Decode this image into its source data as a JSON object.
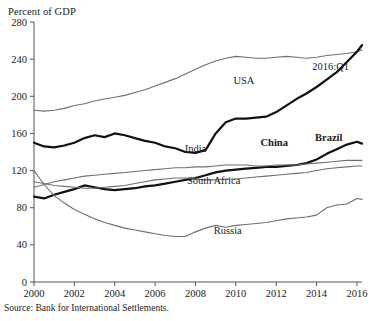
{
  "chart_data": {
    "type": "line",
    "title": "",
    "ylabel": "Percent of GDP",
    "xlabel": "",
    "ylim": [
      0,
      280
    ],
    "xlim": [
      2000,
      2016.25
    ],
    "yticks": [
      0,
      40,
      80,
      120,
      160,
      200,
      240,
      280
    ],
    "xticks": [
      2000,
      2002,
      2004,
      2006,
      2008,
      2010,
      2012,
      2014,
      2016
    ],
    "grid": false,
    "legend_position": "inline-annotations",
    "annotations": [
      {
        "text": "2016:Q1",
        "x": 2014.7,
        "y": 228
      },
      {
        "text": "Percent of GDP",
        "x": 2000,
        "y": 288
      }
    ],
    "source": "Source: Bank for International Settlements.",
    "series": [
      {
        "name": "USA",
        "style": "thin-gray",
        "color": "#6f6f6f",
        "label_x": 2010.4,
        "label_y": 213,
        "x": [
          2000,
          2000.5,
          2001,
          2001.5,
          2002,
          2002.5,
          2003,
          2003.5,
          2004,
          2004.5,
          2005,
          2005.5,
          2006,
          2006.5,
          2007,
          2007.5,
          2008,
          2008.5,
          2009,
          2009.5,
          2010,
          2010.5,
          2011,
          2011.5,
          2012,
          2012.5,
          2013,
          2013.5,
          2014,
          2014.5,
          2015,
          2015.5,
          2016,
          2016.25
        ],
        "y": [
          185,
          184,
          185,
          187,
          190,
          192,
          195,
          197,
          199,
          201,
          204,
          207,
          211,
          215,
          219,
          224,
          229,
          234,
          238,
          241,
          243,
          242,
          241,
          241,
          242,
          243,
          242,
          241,
          242,
          244,
          245,
          246,
          248,
          250
        ]
      },
      {
        "name": "China",
        "style": "thick-black",
        "color": "#111111",
        "label_x": 2011.9,
        "label_y": 146,
        "x": [
          2000,
          2000.5,
          2001,
          2001.5,
          2002,
          2002.5,
          2003,
          2003.5,
          2004,
          2004.5,
          2005,
          2005.5,
          2006,
          2006.5,
          2007,
          2007.5,
          2008,
          2008.5,
          2009,
          2009.5,
          2010,
          2010.5,
          2011,
          2011.5,
          2012,
          2012.5,
          2013,
          2013.5,
          2014,
          2014.5,
          2015,
          2015.5,
          2016,
          2016.25
        ],
        "y": [
          150,
          146,
          145,
          147,
          150,
          155,
          158,
          156,
          160,
          158,
          155,
          152,
          150,
          146,
          144,
          140,
          139,
          142,
          160,
          172,
          176,
          176,
          177,
          178,
          183,
          190,
          197,
          203,
          210,
          218,
          226,
          237,
          248,
          255
        ]
      },
      {
        "name": "Brazil",
        "style": "thick-black",
        "color": "#111111",
        "label_x": 2014.6,
        "label_y": 152,
        "x": [
          2000,
          2000.5,
          2001,
          2001.5,
          2002,
          2002.5,
          2003,
          2003.5,
          2004,
          2004.5,
          2005,
          2005.5,
          2006,
          2006.5,
          2007,
          2007.5,
          2008,
          2008.5,
          2009,
          2009.5,
          2010,
          2010.5,
          2011,
          2011.5,
          2012,
          2012.5,
          2013,
          2013.5,
          2014,
          2014.5,
          2015,
          2015.5,
          2016,
          2016.25
        ],
        "y": [
          92,
          90,
          94,
          97,
          100,
          104,
          102,
          100,
          99,
          100,
          101,
          103,
          104,
          106,
          108,
          110,
          112,
          115,
          118,
          120,
          121,
          122,
          123,
          124,
          124,
          125,
          126,
          128,
          132,
          138,
          143,
          148,
          151,
          149
        ]
      },
      {
        "name": "India",
        "style": "thin-gray",
        "color": "#6f6f6f",
        "label_x": 2008.0,
        "label_y": 140,
        "x": [
          2000,
          2000.5,
          2001,
          2001.5,
          2002,
          2002.5,
          2003,
          2003.5,
          2004,
          2004.5,
          2005,
          2005.5,
          2006,
          2006.5,
          2007,
          2007.5,
          2008,
          2008.5,
          2009,
          2009.5,
          2010,
          2010.5,
          2011,
          2011.5,
          2012,
          2012.5,
          2013,
          2013.5,
          2014,
          2014.5,
          2015,
          2015.5,
          2016,
          2016.25
        ],
        "y": [
          102,
          105,
          108,
          110,
          112,
          114,
          115,
          116,
          117,
          118,
          119,
          120,
          121,
          122,
          123,
          123,
          124,
          124,
          125,
          126,
          126,
          126,
          125,
          125,
          126,
          126,
          126,
          127,
          128,
          129,
          130,
          131,
          131,
          131
        ]
      },
      {
        "name": "South Africa",
        "style": "thin-gray",
        "color": "#6f6f6f",
        "label_x": 2008.9,
        "label_y": 106,
        "x": [
          2000,
          2000.5,
          2001,
          2001.5,
          2002,
          2002.5,
          2003,
          2003.5,
          2004,
          2004.5,
          2005,
          2005.5,
          2006,
          2006.5,
          2007,
          2007.5,
          2008,
          2008.5,
          2009,
          2009.5,
          2010,
          2010.5,
          2011,
          2011.5,
          2012,
          2012.5,
          2013,
          2013.5,
          2014,
          2014.5,
          2015,
          2015.5,
          2016,
          2016.25
        ],
        "y": [
          108,
          106,
          104,
          103,
          102,
          101,
          101,
          102,
          103,
          104,
          106,
          108,
          110,
          111,
          112,
          112,
          111,
          110,
          110,
          111,
          111,
          112,
          113,
          114,
          115,
          116,
          117,
          118,
          120,
          122,
          123,
          124,
          125,
          125
        ]
      },
      {
        "name": "Russia",
        "style": "thin-gray",
        "color": "#6f6f6f",
        "label_x": 2009.6,
        "label_y": 52,
        "x": [
          2000,
          2000.5,
          2001,
          2001.5,
          2002,
          2002.5,
          2003,
          2003.5,
          2004,
          2004.5,
          2005,
          2005.5,
          2006,
          2006.5,
          2007,
          2007.5,
          2008,
          2008.5,
          2009,
          2009.5,
          2010,
          2010.5,
          2011,
          2011.5,
          2012,
          2012.5,
          2013,
          2013.5,
          2014,
          2014.5,
          2015,
          2015.5,
          2016,
          2016.25
        ],
        "y": [
          120,
          105,
          93,
          85,
          78,
          73,
          68,
          64,
          61,
          58,
          56,
          54,
          52,
          50,
          49,
          49,
          54,
          58,
          61,
          59,
          61,
          62,
          63,
          64,
          66,
          68,
          69,
          70,
          72,
          80,
          83,
          84,
          90,
          89
        ]
      }
    ]
  },
  "source_note": "Source: Bank for International Settlements."
}
